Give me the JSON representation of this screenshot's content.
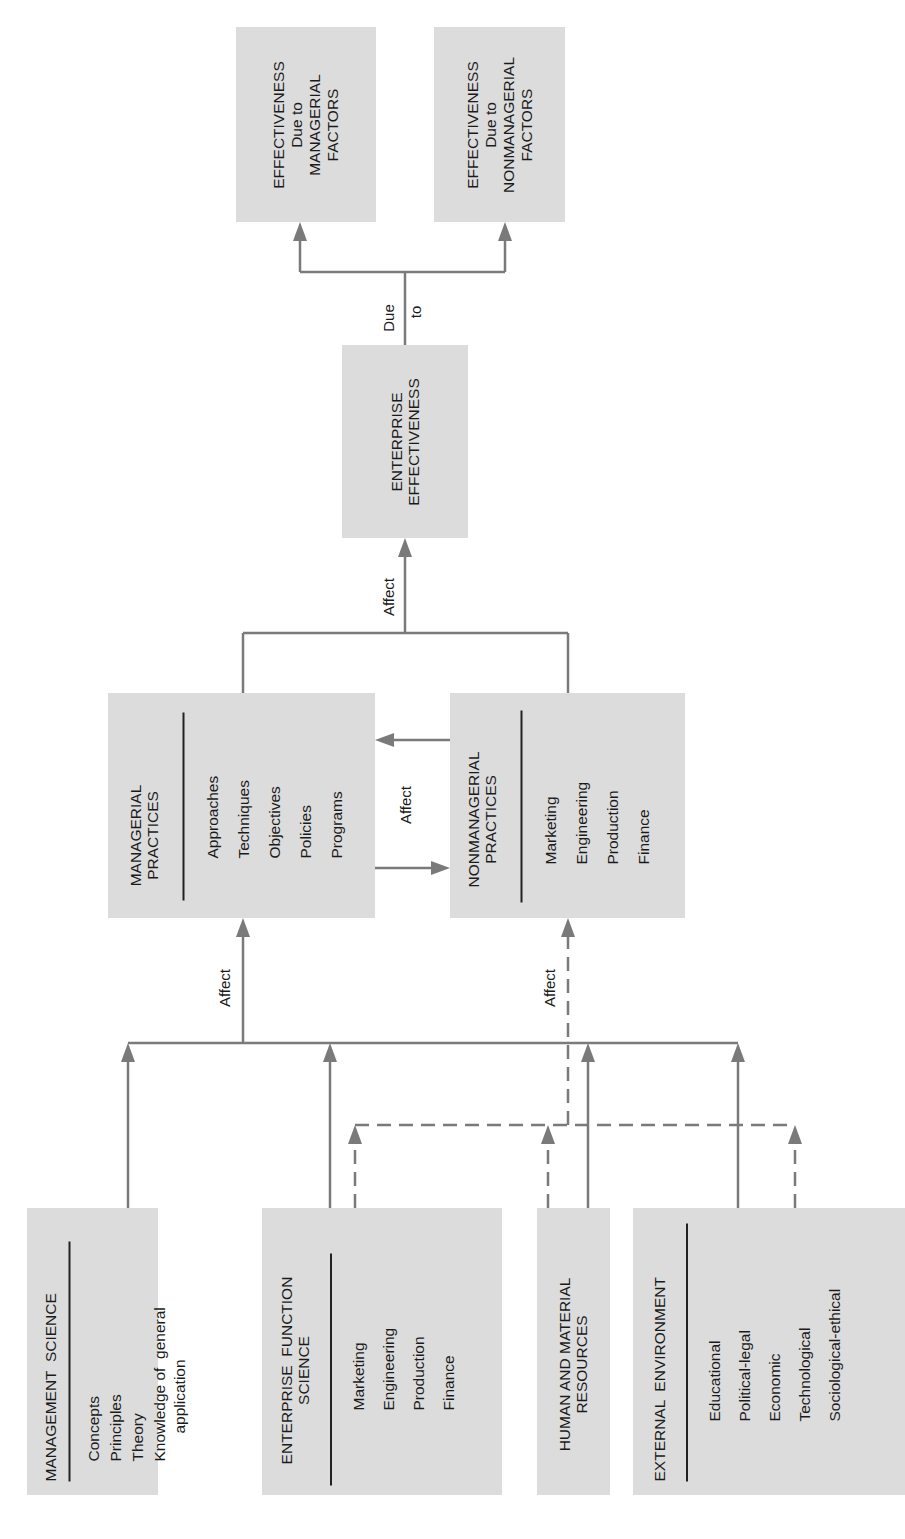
{
  "diagram": {
    "orientation": "rotated-90-ccw",
    "colors": {
      "box_fill": "#dcdcdc",
      "line": "#7a7a7a",
      "text": "#1a1a1a"
    },
    "sources": [
      {
        "id": "management_science",
        "title": "MANAGEMENT  SCIENCE",
        "items": [
          "Concepts",
          "Principles",
          "Theory",
          "Knowledge of  general",
          "application"
        ]
      },
      {
        "id": "enterprise_function_science",
        "title_lines": [
          "ENTERPRISE  FUNCTION",
          "SCIENCE"
        ],
        "items": [
          "Marketing",
          "Engineering",
          "Production",
          "Finance"
        ]
      },
      {
        "id": "human_material_resources",
        "title_lines": [
          "HUMAN AND MATERIAL",
          "RESOURCES"
        ]
      },
      {
        "id": "external_environment",
        "title": "EXTERNAL  ENVIRONMENT",
        "items": [
          "Educational",
          "Political-legal",
          "Economic",
          "Technological",
          "Sociological-ethical"
        ]
      }
    ],
    "practices": [
      {
        "id": "managerial_practices",
        "title_lines": [
          "MANAGERIAL",
          "PRACTICES"
        ],
        "items": [
          "Approaches",
          "Techniques",
          "Objectives",
          "Policies",
          "Programs"
        ]
      },
      {
        "id": "nonmanagerial_practices",
        "title_lines": [
          "NONMANAGERIAL",
          "PRACTICES"
        ],
        "items": [
          "Marketing",
          "Engineering",
          "Production",
          "Finance"
        ]
      }
    ],
    "effectiveness": {
      "title_lines": [
        "ENTERPRISE",
        "EFFECTIVENESS"
      ]
    },
    "outcomes": [
      {
        "id": "managerial_factors",
        "title_lines": [
          "EFFECTIVENESS",
          "Due to",
          "MANAGERIAL",
          "FACTORS"
        ]
      },
      {
        "id": "nonmanagerial_factors",
        "title_lines": [
          "EFFECTIVENESS",
          "Due to",
          "NONMANAGERIAL",
          "FACTORS"
        ]
      }
    ],
    "labels": {
      "affect_managerial": "Affect",
      "affect_nonmanagerial": "Affect",
      "affect_mutual": "Affect",
      "affect_effectiveness": "Affect",
      "due": "Due",
      "to": "to"
    },
    "edges": [
      {
        "from": "management_science",
        "to": "managerial_practices",
        "style": "solid"
      },
      {
        "from": "enterprise_function_science",
        "to": "managerial_practices",
        "style": "solid"
      },
      {
        "from": "human_material_resources",
        "to": "managerial_practices",
        "style": "solid"
      },
      {
        "from": "external_environment",
        "to": "managerial_practices",
        "style": "solid"
      },
      {
        "from": "enterprise_function_science",
        "to": "nonmanagerial_practices",
        "style": "dashed"
      },
      {
        "from": "human_material_resources",
        "to": "nonmanagerial_practices",
        "style": "dashed"
      },
      {
        "from": "external_environment",
        "to": "nonmanagerial_practices",
        "style": "dashed"
      },
      {
        "from": "managerial_practices",
        "to": "nonmanagerial_practices",
        "style": "solid",
        "label": "Affect"
      },
      {
        "from": "nonmanagerial_practices",
        "to": "managerial_practices",
        "style": "solid"
      },
      {
        "from": "managerial_practices",
        "to": "enterprise_effectiveness",
        "style": "solid",
        "label": "Affect"
      },
      {
        "from": "nonmanagerial_practices",
        "to": "enterprise_effectiveness",
        "style": "solid"
      },
      {
        "from": "enterprise_effectiveness",
        "to": "managerial_factors",
        "style": "solid",
        "label": "Due to"
      },
      {
        "from": "enterprise_effectiveness",
        "to": "nonmanagerial_factors",
        "style": "solid"
      }
    ]
  }
}
